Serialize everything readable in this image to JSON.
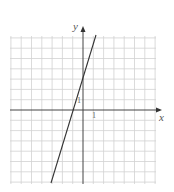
{
  "chart_data": {
    "type": "line",
    "title": "",
    "xlabel": "x",
    "ylabel": "y",
    "tick_labels": {
      "x": "1",
      "y": "1"
    },
    "grid": true,
    "xlim": [
      -7,
      7
    ],
    "ylim": [
      -7,
      7
    ],
    "series": [
      {
        "name": "y = 3x + 3",
        "x": [
          -3.2,
          1.3
        ],
        "y": [
          -6.6,
          6.9
        ]
      }
    ],
    "points": [
      {
        "x": -1,
        "y": 0
      },
      {
        "x": 0,
        "y": 3
      }
    ]
  },
  "labels": {
    "x_axis": "x",
    "y_axis": "y",
    "x_tick": "1",
    "y_tick": "1"
  },
  "colors": {
    "grid": "#d0d0d0",
    "axis": "#444444",
    "line": "#333333"
  }
}
